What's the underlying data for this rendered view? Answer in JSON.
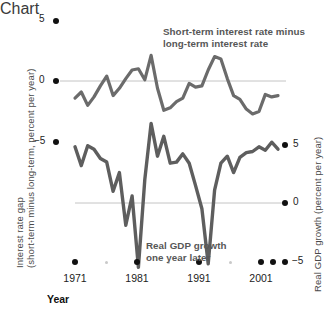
{
  "chart_data": {
    "type": "line",
    "title": "",
    "subtitle": "",
    "xlabel": "Year",
    "grid": false,
    "legend_position": "inline-annotations",
    "xlim": [
      1968,
      2003
    ],
    "x_ticks": [
      1971,
      1981,
      1991,
      2001
    ],
    "x_minor_ticks": [
      1976,
      1986,
      1996
    ],
    "axes": [
      {
        "id": "left",
        "label": "Interest rate gap (short-term minus long-term, percent per year)",
        "label_line1": "Interest rate gap",
        "label_line2": "(short-term minus long-term, percent per year)",
        "ticks": [
          5,
          0,
          -5
        ],
        "tick_labels": [
          "5",
          "0",
          "−5"
        ],
        "ylim": [
          -7.5,
          6.5
        ]
      },
      {
        "id": "right",
        "label": "Real GDP growth (percent per year)",
        "ticks": [
          5,
          0,
          -5
        ],
        "tick_labels": [
          "5",
          "0",
          "−5"
        ],
        "ylim": [
          -7.0,
          8.5
        ]
      }
    ],
    "annotations": [
      {
        "id": "interest-rate-gap-annotation",
        "text": "Short-term interest rate minus long-term interest rate",
        "line1": "Short-term interest rate minus",
        "line2": "long-term interest rate"
      },
      {
        "id": "gdp-growth-annotation",
        "text": "Real GDP growth one year later",
        "line1": "Real GDP growth",
        "line2": "one year later"
      }
    ],
    "series": [
      {
        "name": "Short-term interest rate minus long-term interest rate",
        "axis": "left",
        "color": "#6b6b6b",
        "x": [
          1969,
          1970,
          1971,
          1972,
          1973,
          1974,
          1975,
          1976,
          1977,
          1978,
          1979,
          1980,
          1981,
          1982,
          1983,
          1984,
          1985,
          1986,
          1987,
          1988,
          1989,
          1990,
          1991,
          1992,
          1993,
          1994,
          1995,
          1996,
          1997,
          1998,
          1999,
          2000,
          2001
        ],
        "values": [
          -1.4,
          -0.9,
          -2.0,
          -1.3,
          -0.4,
          0.4,
          -1.2,
          -0.6,
          0.2,
          0.9,
          1.0,
          0.1,
          2.1,
          -0.6,
          -2.4,
          -2.2,
          -1.7,
          -1.4,
          -0.2,
          -0.5,
          -0.4,
          0.9,
          2.0,
          1.8,
          0.2,
          -1.2,
          -1.5,
          -2.3,
          -2.7,
          -2.5,
          -1.1,
          -1.3,
          -1.2
        ]
      },
      {
        "name": "Real GDP growth one year later",
        "axis": "right",
        "color": "#5e5e5e",
        "x": [
          1969,
          1970,
          1971,
          1972,
          1973,
          1974,
          1975,
          1976,
          1977,
          1978,
          1979,
          1980,
          1981,
          1982,
          1983,
          1984,
          1985,
          1986,
          1987,
          1988,
          1989,
          1990,
          1991,
          1992,
          1993,
          1994,
          1995,
          1996,
          1997,
          1998,
          1999,
          2000,
          2001
        ],
        "values": [
          4.8,
          3.2,
          4.9,
          4.6,
          3.8,
          3.5,
          1.0,
          2.6,
          -1.9,
          0.6,
          -5.5,
          2.0,
          6.8,
          4.0,
          5.7,
          3.4,
          3.5,
          4.2,
          3.4,
          1.5,
          -0.5,
          -5.2,
          1.1,
          3.4,
          4.0,
          2.6,
          3.9,
          4.3,
          4.4,
          4.8,
          4.5,
          5.2,
          4.6
        ]
      }
    ]
  },
  "ticks": {
    "left": {
      "t5": "5",
      "t0": "0",
      "tm5": "−5"
    },
    "right": {
      "t5": "5",
      "t0": "0",
      "tm5": "−5"
    },
    "x": {
      "x1971": "1971",
      "x1981": "1981",
      "x1991": "1991",
      "x2001": "2001"
    }
  },
  "labels": {
    "left_line1": "Interest rate gap",
    "left_line2": "(short-term minus long-term, percent per year)",
    "right": "Real GDP growth (percent per year)",
    "year": "Year"
  },
  "annotations": {
    "top_line1": "Short-term interest rate minus",
    "top_line2": "long-term interest rate",
    "bottom_line1": "Real GDP growth",
    "bottom_line2": "one year later"
  },
  "colors": {
    "line": "#6b6b6b",
    "zero_line": "#bdbdbd",
    "tick_dot": "#111111",
    "minor_dot": "#c9c9c9",
    "text": "#4a4a4a"
  }
}
